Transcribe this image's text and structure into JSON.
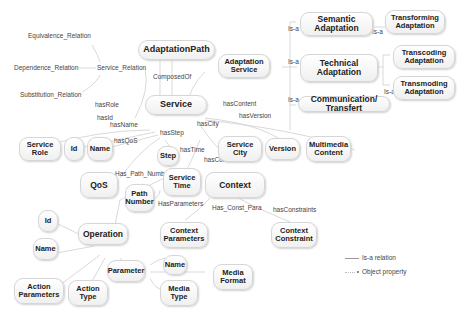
{
  "nodes": {
    "adaptation_path": "AdaptationPath",
    "adaptation_service": "Adaptation Service",
    "semantic_adaptation": "Semantic Adaptation",
    "technical_adaptation": "Technical Adaptation",
    "communication_transfert": "Communication/ Transfert",
    "transforming_adaptation": "Transforming Adaptation",
    "transcoding_adaptation": "Transcoding Adaptation",
    "transmoding_adaptation": "Transmoding Adaptation",
    "service": "Service",
    "service_role": "Service Role",
    "id_1": "Id",
    "name_1": "Name",
    "step": "Step",
    "service_city": "Service City",
    "version": "Version",
    "multimedia_content": "Multimedia Content",
    "qos": "QoS",
    "path_number": "Path Number",
    "service_time": "Service Time",
    "context": "Context",
    "operation": "Operation",
    "id_2": "Id",
    "name_2": "Name",
    "context_parameters": "Context Parameters",
    "context_constraint": "Context Constraint",
    "parameter": "Parameter",
    "name_3": "Name",
    "media_format": "Media Format",
    "media_type": "Media Type",
    "action_parameters": "Action Parameters",
    "action_type": "Action Type"
  },
  "relations": {
    "equivalence": "Equivalence_Relation",
    "dependence": "Dependence_Relation",
    "substitution": "Substitution_Relation",
    "service_relation": "Service_Relation",
    "composed_of": "ComposedOf",
    "is_a_1": "Is-a",
    "is_a_2": "Is-a",
    "is_a_3": "Is-a",
    "is_a_4": "Is-a",
    "is_a_5": "Is-a",
    "has_role": "hasRole",
    "has_id": "hasId",
    "has_name": "hasName",
    "has_qos": "hasQoS",
    "has_step": "hasStep",
    "has_city": "hasCity",
    "has_content": "hasContent",
    "has_version": "hasVersion",
    "has_time": "hasTime",
    "has_context": "hasContext",
    "has_path_number": "Has_Path_Number",
    "has_parameters": "HasParameters",
    "has_const_para": "Has_Const_Para",
    "has_constraints": "hasConstraints"
  },
  "legend": {
    "is_a": "Is-a relation",
    "object_property": "Object property"
  },
  "colors": {
    "node_border": "#d6d6d6",
    "node_fill": "#f4f4f4",
    "edge": "#c8c8c8",
    "text": "#222222"
  }
}
